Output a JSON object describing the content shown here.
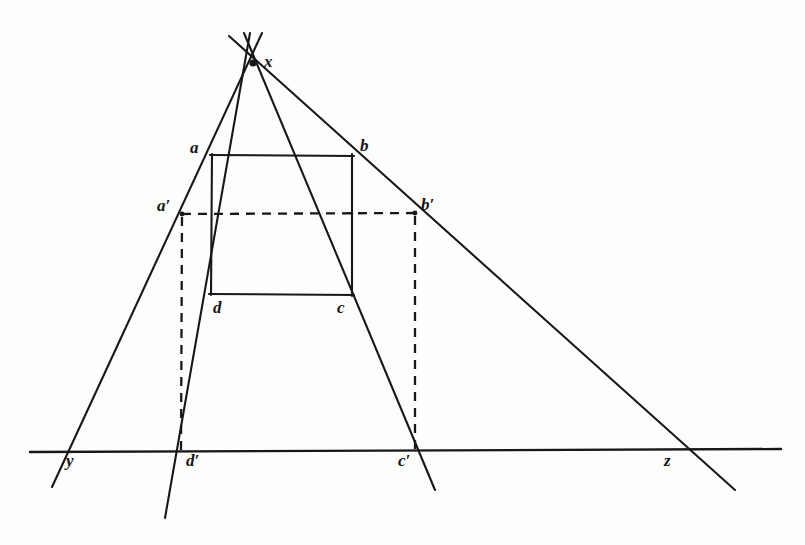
{
  "figure": {
    "kind": "geometric-perspective-projection-diagram",
    "background_color": "#fdfdfc",
    "stroke_color": "#181818",
    "labels": {
      "x": "x",
      "a": "a",
      "b": "b",
      "c": "c",
      "d": "d",
      "a_prime": "a′",
      "b_prime": "b′",
      "c_prime": "c′",
      "d_prime": "d′",
      "y": "y",
      "z": "z"
    },
    "points": {
      "x": [
        253,
        63
      ],
      "a": [
        212,
        155
      ],
      "b": [
        352,
        155
      ],
      "c": [
        352,
        295
      ],
      "d": [
        211,
        294
      ],
      "a_prime": [
        182,
        214
      ],
      "b_prime": [
        415,
        213
      ],
      "c_prime": [
        415,
        452
      ],
      "d_prime": [
        181,
        452
      ],
      "y": [
        62,
        452
      ],
      "z": [
        675,
        450
      ]
    },
    "label_positions": {
      "x": [
        264,
        53
      ],
      "a": [
        190,
        139
      ],
      "b": [
        360,
        137
      ],
      "c": [
        337,
        299
      ],
      "d": [
        213,
        299
      ],
      "a_prime": [
        157,
        197
      ],
      "b_prime": [
        421,
        196
      ],
      "c_prime": [
        398,
        452
      ],
      "d_prime": [
        186,
        452
      ],
      "y": [
        66,
        452
      ],
      "z": [
        664,
        452
      ]
    },
    "lines": [
      {
        "name": "ray-x-through-a-aprime-y",
        "from": [
          262,
          33
        ],
        "to": [
          52,
          487
        ],
        "style": "solid"
      },
      {
        "name": "ray-x-through-d-dprime",
        "from": [
          250,
          33
        ],
        "to": [
          165,
          518
        ],
        "style": "solid"
      },
      {
        "name": "ray-x-through-c-cprime",
        "from": [
          244,
          33
        ],
        "to": [
          435,
          490
        ],
        "style": "solid"
      },
      {
        "name": "ray-x-through-b-bprime-z",
        "from": [
          229,
          36
        ],
        "to": [
          735,
          490
        ],
        "style": "solid"
      },
      {
        "name": "ground-line-horizontal",
        "from": [
          30,
          452
        ],
        "to": [
          781,
          449
        ],
        "style": "solid"
      },
      {
        "name": "square-side-ab",
        "from": [
          211,
          155
        ],
        "to": [
          353,
          156
        ],
        "style": "solid"
      },
      {
        "name": "square-side-bc",
        "from": [
          352,
          155
        ],
        "to": [
          352,
          296
        ],
        "style": "solid"
      },
      {
        "name": "square-side-dc",
        "from": [
          210,
          294
        ],
        "to": [
          353,
          295
        ],
        "style": "solid"
      },
      {
        "name": "square-side-ad",
        "from": [
          212,
          155
        ],
        "to": [
          211,
          294
        ],
        "style": "solid"
      },
      {
        "name": "dashed-horizontal-aprime-bprime",
        "from": [
          182,
          214
        ],
        "to": [
          415,
          213
        ],
        "style": "dashed"
      },
      {
        "name": "dashed-vertical-aprime-dprime",
        "from": [
          182,
          216
        ],
        "to": [
          181,
          452
        ],
        "style": "dashed"
      },
      {
        "name": "dashed-vertical-bprime-cprime",
        "from": [
          415,
          215
        ],
        "to": [
          415,
          452
        ],
        "style": "dashed"
      }
    ]
  }
}
